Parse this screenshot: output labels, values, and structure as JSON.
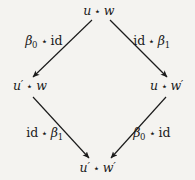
{
  "diagram": {
    "kind": "commutative-square",
    "background_color": "#f4f3f0",
    "ink_color": "#1b1b1b",
    "operator_symbol": "⋆",
    "nodes": [
      {
        "id": "top",
        "text": "u ⋆ w",
        "base1": "u",
        "prime1": "",
        "base2": "w",
        "prime2": "",
        "x": 99,
        "y": 11
      },
      {
        "id": "left",
        "text": "u′ ⋆ w",
        "base1": "u",
        "prime1": "′",
        "base2": "w",
        "prime2": "",
        "x": 30,
        "y": 86
      },
      {
        "id": "right",
        "text": "u ⋆ w′",
        "base1": "u",
        "prime1": "",
        "base2": "w",
        "prime2": "′",
        "x": 167,
        "y": 86
      },
      {
        "id": "bottom",
        "text": "u′ ⋆ w′",
        "base1": "u",
        "prime1": "′",
        "base2": "w",
        "prime2": "′",
        "x": 98,
        "y": 168
      }
    ],
    "edges": [
      {
        "id": "upper-left",
        "from": "top",
        "to": "left",
        "label": "β₀ ⋆ id",
        "left_term": "β",
        "left_sub": "0",
        "right_term": "id",
        "x1": 92,
        "y1": 20,
        "x2": 33,
        "y2": 77,
        "label_x": 44,
        "label_y": 41
      },
      {
        "id": "upper-right",
        "from": "top",
        "to": "right",
        "label": "id ⋆ β₁",
        "left_term": "id",
        "right_term": "β",
        "right_sub": "1",
        "x1": 110,
        "y1": 20,
        "x2": 167,
        "y2": 77,
        "label_x": 152,
        "label_y": 41
      },
      {
        "id": "lower-left",
        "from": "left",
        "to": "bottom",
        "label": "id ⋆ β₁",
        "left_term": "id",
        "right_term": "β",
        "right_sub": "1",
        "x1": 33,
        "y1": 97,
        "x2": 89,
        "y2": 158,
        "label_x": 45,
        "label_y": 133
      },
      {
        "id": "lower-right",
        "from": "right",
        "to": "bottom",
        "label": "β₀ ⋆ id",
        "left_term": "β",
        "left_sub": "0",
        "right_term": "id",
        "x1": 166,
        "y1": 97,
        "x2": 111,
        "y2": 158,
        "label_x": 152,
        "label_y": 133
      }
    ]
  }
}
